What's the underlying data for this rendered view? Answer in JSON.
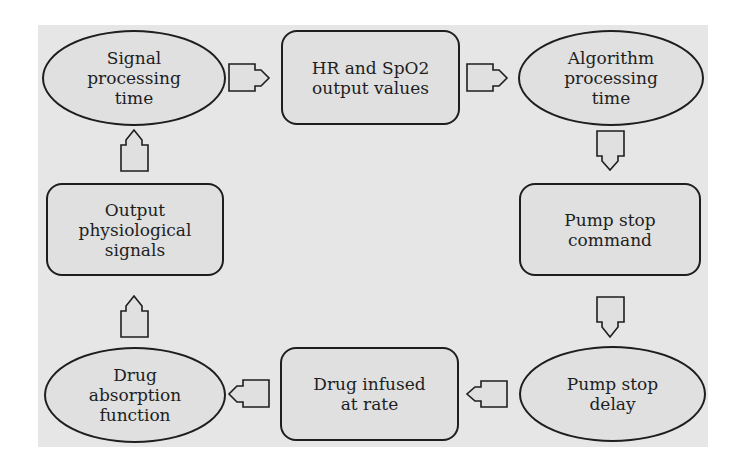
{
  "diagram": {
    "type": "closed-loop flowchart",
    "colors": {
      "background": "#e6e6e6",
      "node_fill": "#e0e0e0",
      "stroke": "#1e1e1e"
    },
    "nodes": [
      {
        "id": "signal-processing-time",
        "shape": "ellipse",
        "label": "Signal\nprocessing\ntime"
      },
      {
        "id": "hr-spo2-output-values",
        "shape": "rounded-rect",
        "label": "HR and SpO2\noutput values"
      },
      {
        "id": "algorithm-processing-time",
        "shape": "ellipse",
        "label": "Algorithm\nprocessing\ntime"
      },
      {
        "id": "pump-stop-command",
        "shape": "rounded-rect",
        "label": "Pump stop\ncommand"
      },
      {
        "id": "pump-stop-delay",
        "shape": "ellipse",
        "label": "Pump stop\ndelay"
      },
      {
        "id": "drug-infused-at-rate",
        "shape": "rounded-rect",
        "label": "Drug infused\nat rate"
      },
      {
        "id": "drug-absorption-function",
        "shape": "ellipse",
        "label": "Drug\nabsorption\nfunction"
      },
      {
        "id": "output-physiological-signals",
        "shape": "rounded-rect",
        "label": "Output\nphysiological\nsignals"
      }
    ],
    "edges": [
      {
        "from": "signal-processing-time",
        "to": "hr-spo2-output-values",
        "direction": "right"
      },
      {
        "from": "hr-spo2-output-values",
        "to": "algorithm-processing-time",
        "direction": "right"
      },
      {
        "from": "algorithm-processing-time",
        "to": "pump-stop-command",
        "direction": "down"
      },
      {
        "from": "pump-stop-command",
        "to": "pump-stop-delay",
        "direction": "down"
      },
      {
        "from": "pump-stop-delay",
        "to": "drug-infused-at-rate",
        "direction": "left"
      },
      {
        "from": "drug-infused-at-rate",
        "to": "drug-absorption-function",
        "direction": "left"
      },
      {
        "from": "drug-absorption-function",
        "to": "output-physiological-signals",
        "direction": "up"
      },
      {
        "from": "output-physiological-signals",
        "to": "signal-processing-time",
        "direction": "up"
      }
    ]
  }
}
